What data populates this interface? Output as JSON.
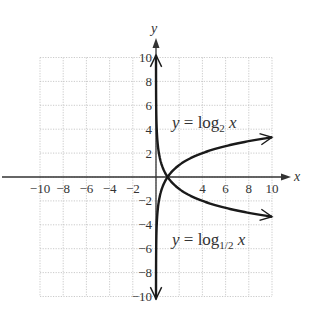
{
  "chart_data": {
    "type": "line",
    "title": "",
    "xlabel": "x",
    "ylabel": "y",
    "xlim": [
      -10,
      10
    ],
    "ylim": [
      -10,
      10
    ],
    "grid": true,
    "grid_step": 2,
    "x_ticks": [
      -10,
      -8,
      -6,
      -4,
      -2,
      4,
      6,
      8,
      10
    ],
    "x_tick_labels": [
      "−10",
      "−8",
      "−6",
      "−4",
      "−2",
      "4",
      "6",
      "8",
      "10"
    ],
    "y_ticks": [
      10,
      8,
      6,
      4,
      2,
      -2,
      -4,
      -6,
      -8,
      -10
    ],
    "y_tick_labels": [
      "10",
      "8",
      "6",
      "4",
      "2",
      "−2",
      "−4",
      "−6",
      "−8",
      "−10"
    ],
    "series": [
      {
        "name": "y = log2 x",
        "base": 2,
        "label": {
          "prefix": "y",
          "eq": " = log",
          "sub": "2",
          "var": " x"
        },
        "x": [
          0.001,
          0.01,
          0.1,
          0.25,
          0.5,
          1,
          2,
          4,
          6,
          8,
          10
        ],
        "values": [
          -9.97,
          -6.64,
          -3.32,
          -2,
          -1,
          0,
          1,
          2,
          2.58,
          3,
          3.32
        ]
      },
      {
        "name": "y = log1/2 x",
        "base": 0.5,
        "label": {
          "prefix": "y",
          "eq": " = log",
          "sub": "1/2",
          "var": " x"
        },
        "x": [
          0.001,
          0.01,
          0.1,
          0.25,
          0.5,
          1,
          2,
          4,
          6,
          8,
          10
        ],
        "values": [
          9.97,
          6.64,
          3.32,
          2,
          1,
          0,
          -1,
          -2,
          -2.58,
          -3,
          -3.32
        ]
      }
    ],
    "annotations": [
      "y = log₂ x",
      "y = log₁/₂ x"
    ],
    "colors": {
      "curve": "#1a1a1a",
      "grid": "#bdbdbd",
      "axis": "#333333",
      "text": "#333333"
    }
  }
}
